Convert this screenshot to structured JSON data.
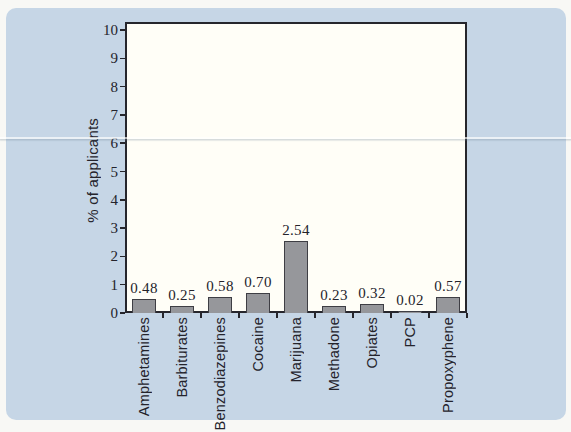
{
  "scene": {
    "page_background": "#f8f8f5",
    "panel_color": "#c6d6e6"
  },
  "chart_data": {
    "type": "bar",
    "title": "",
    "xlabel": "",
    "ylabel": "% of applicants",
    "categories": [
      "Amphetamines",
      "Barbiturates",
      "Benzodiazepines",
      "Cocaine",
      "Marijuana",
      "Methadone",
      "Opiates",
      "PCP",
      "Propoxyphene"
    ],
    "values": [
      0.48,
      0.25,
      0.58,
      0.7,
      2.54,
      0.23,
      0.32,
      0.02,
      0.57
    ],
    "value_labels": [
      "0.48",
      "0.25",
      "0.58",
      "0.70",
      "2.54",
      "0.23",
      "0.32",
      "0.02",
      "0.57"
    ],
    "ylim": [
      0,
      10
    ],
    "yticks": [
      0,
      1,
      2,
      3,
      4,
      5,
      6,
      7,
      8,
      9,
      10
    ],
    "grid": false,
    "legend_position": "none",
    "plot_bg": "#fffef7",
    "axis_color": "#26262c",
    "bar_fill": "#96979b",
    "bar_border": "#3e3e44",
    "text_color": "#24232b"
  }
}
